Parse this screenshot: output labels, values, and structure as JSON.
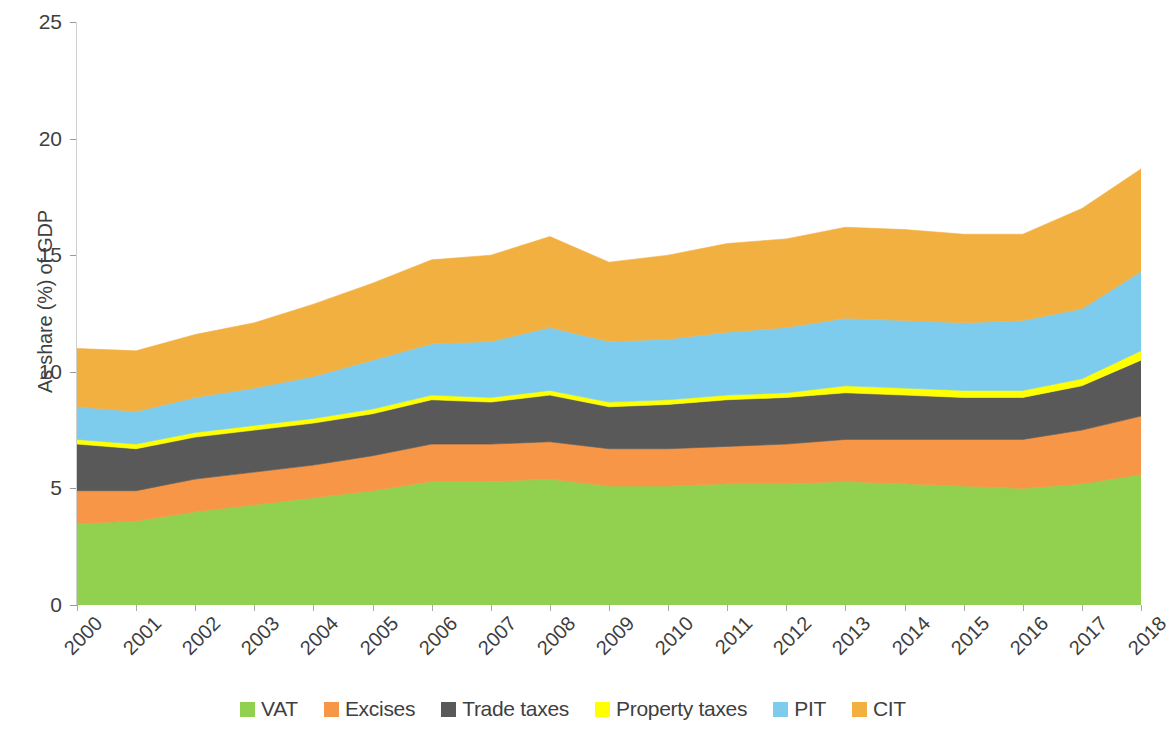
{
  "chart_data": {
    "type": "area",
    "stacked": true,
    "title": "",
    "subtitle": "",
    "xlabel": "",
    "ylabel": "As share (%) of GDP",
    "xlim": [
      2000,
      2018
    ],
    "ylim": [
      0,
      25
    ],
    "yticks": [
      0,
      5,
      10,
      15,
      20,
      25
    ],
    "grid": false,
    "legend_position": "bottom",
    "categories": [
      "2000",
      "2001",
      "2002",
      "2003",
      "2004",
      "2005",
      "2006",
      "2007",
      "2008",
      "2009",
      "2010",
      "2011",
      "2012",
      "2013",
      "2014",
      "2015",
      "2016",
      "2017",
      "2018"
    ],
    "series": [
      {
        "name": "VAT",
        "color": "#92d050",
        "values": [
          3.5,
          3.6,
          4.0,
          4.3,
          4.6,
          4.9,
          5.3,
          5.3,
          5.4,
          5.1,
          5.1,
          5.2,
          5.2,
          5.3,
          5.2,
          5.1,
          5.0,
          5.2,
          5.6
        ]
      },
      {
        "name": "Excises",
        "color": "#f79646",
        "values": [
          1.4,
          1.3,
          1.4,
          1.4,
          1.4,
          1.5,
          1.6,
          1.6,
          1.6,
          1.6,
          1.6,
          1.6,
          1.7,
          1.8,
          1.9,
          2.0,
          2.1,
          2.3,
          2.5
        ]
      },
      {
        "name": "Trade taxes",
        "color": "#595959",
        "values": [
          2.0,
          1.8,
          1.8,
          1.8,
          1.8,
          1.8,
          1.9,
          1.8,
          2.0,
          1.8,
          1.9,
          2.0,
          2.0,
          2.0,
          1.9,
          1.8,
          1.8,
          1.9,
          2.4
        ]
      },
      {
        "name": "Property taxes",
        "color": "#ffff00",
        "values": [
          0.2,
          0.2,
          0.2,
          0.2,
          0.2,
          0.2,
          0.2,
          0.2,
          0.2,
          0.2,
          0.2,
          0.2,
          0.2,
          0.3,
          0.3,
          0.3,
          0.3,
          0.3,
          0.4
        ]
      },
      {
        "name": "PIT",
        "color": "#7ecced",
        "values": [
          1.4,
          1.4,
          1.5,
          1.6,
          1.8,
          2.1,
          2.2,
          2.4,
          2.7,
          2.6,
          2.6,
          2.7,
          2.8,
          2.9,
          2.9,
          2.9,
          3.0,
          3.0,
          3.4
        ]
      },
      {
        "name": "CIT",
        "color": "#f2b041",
        "values": [
          2.5,
          2.6,
          2.7,
          2.8,
          3.1,
          3.3,
          3.6,
          3.7,
          3.9,
          3.4,
          3.6,
          3.8,
          3.8,
          3.9,
          3.9,
          3.8,
          3.7,
          4.3,
          4.4
        ]
      }
    ],
    "stack_tops": {
      "VAT": [
        3.5,
        3.6,
        4.0,
        4.3,
        4.6,
        4.9,
        5.3,
        5.3,
        5.4,
        5.1,
        5.1,
        5.2,
        5.2,
        5.3,
        5.2,
        5.1,
        5.0,
        5.2,
        5.6
      ],
      "Excises": [
        4.9,
        4.9,
        5.4,
        5.7,
        6.0,
        6.4,
        6.9,
        6.9,
        7.0,
        6.7,
        6.7,
        6.8,
        6.9,
        7.1,
        7.1,
        7.1,
        7.1,
        7.5,
        8.1
      ],
      "Trade taxes": [
        6.9,
        6.7,
        7.2,
        7.5,
        7.8,
        8.2,
        8.8,
        8.7,
        9.0,
        8.5,
        8.6,
        8.8,
        8.9,
        9.1,
        9.0,
        8.9,
        8.9,
        9.4,
        10.5
      ],
      "Property taxes": [
        7.1,
        6.9,
        7.4,
        7.7,
        8.0,
        8.4,
        9.0,
        8.9,
        9.2,
        8.7,
        8.8,
        9.0,
        9.1,
        9.4,
        9.3,
        9.2,
        9.2,
        9.7,
        10.9
      ],
      "PIT": [
        8.5,
        8.3,
        8.9,
        9.3,
        9.8,
        10.5,
        11.2,
        11.3,
        11.9,
        11.3,
        11.4,
        11.7,
        11.9,
        12.3,
        12.2,
        12.1,
        12.2,
        12.7,
        14.3
      ],
      "CIT": [
        11.0,
        10.9,
        11.6,
        12.1,
        12.9,
        13.8,
        14.8,
        15.0,
        15.8,
        14.7,
        15.0,
        15.5,
        15.7,
        16.2,
        16.1,
        15.9,
        15.9,
        17.0,
        18.7
      ]
    }
  },
  "legend": {
    "items": [
      {
        "label": "VAT"
      },
      {
        "label": "Excises"
      },
      {
        "label": "Trade taxes"
      },
      {
        "label": "Property taxes"
      },
      {
        "label": "PIT"
      },
      {
        "label": "CIT"
      }
    ]
  }
}
